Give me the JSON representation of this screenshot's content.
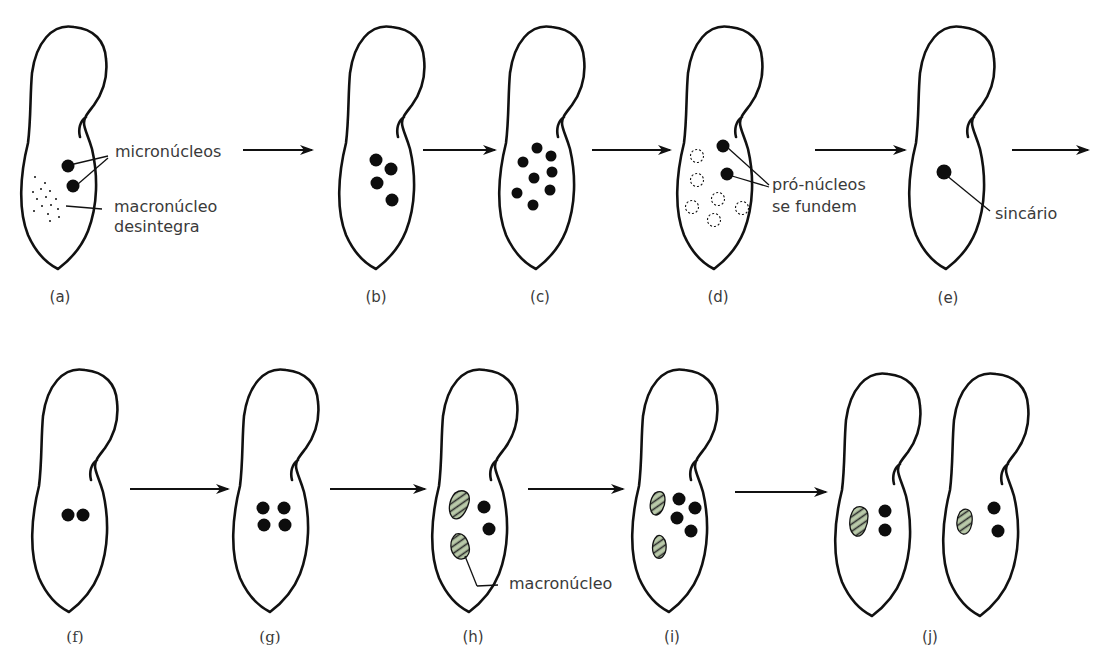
{
  "figure": {
    "title": "",
    "colors": {
      "outline": "#111111",
      "micronucleus": "#0d0d0d",
      "macronucleus_fill": "#b9c9a9",
      "macronucleus_stripe": "#2a2a2a"
    },
    "stages": [
      {
        "id": "a",
        "caption": "(a)",
        "micronuclei": 2,
        "note": "macronucleus disintegrating (dotted)"
      },
      {
        "id": "b",
        "caption": "(b)",
        "micronuclei": 4
      },
      {
        "id": "c",
        "caption": "(c)",
        "micronuclei": 8
      },
      {
        "id": "d",
        "caption": "(d)",
        "micronuclei": 2,
        "degenerating": 7
      },
      {
        "id": "e",
        "caption": "(e)",
        "micronuclei": 1
      },
      {
        "id": "f",
        "caption": "(f)",
        "micronuclei": 2
      },
      {
        "id": "g",
        "caption": "(g)",
        "micronuclei": 4
      },
      {
        "id": "h",
        "caption": "(h)",
        "micronuclei": 2,
        "macronuclei": 2
      },
      {
        "id": "i",
        "caption": "(i)",
        "micronuclei": 4,
        "macronuclei": 2
      },
      {
        "id": "j",
        "caption": "(j)",
        "cells": 2,
        "micronuclei_per_cell": 2,
        "macronuclei_per_cell": 1
      }
    ],
    "labels": {
      "micronucleos": "micronúcleos",
      "macronucleo_desintegra_1": "macronúcleo",
      "macronucleo_desintegra_2": "desintegra",
      "pronucleos_1": "pró-núcleos",
      "pronucleos_2": "se fundem",
      "sincario": "sincário",
      "macronucleo": "macronúcleo"
    }
  }
}
